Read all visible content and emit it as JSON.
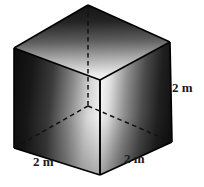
{
  "figure": {
    "name": "cube-diagram",
    "shape": "cube",
    "background_color": "#ffffff",
    "edge_color": "#000000",
    "labels": {
      "right_edge": "2 m",
      "bottom_left_edge": "2 m",
      "bottom_right_edge": "2 m"
    },
    "geometry": {
      "top_vertex": [
        88,
        5
      ],
      "top_left_vertex": [
        14,
        48
      ],
      "top_right_vertex": [
        170,
        42
      ],
      "center_top_vertex": [
        100,
        80
      ],
      "bottom_left_vertex": [
        14,
        148
      ],
      "bottom_front_vertex": [
        100,
        175
      ],
      "bottom_right_vertex": [
        172,
        142
      ],
      "hidden_back_bottom_vertex": [
        88,
        106
      ]
    },
    "shading": {
      "top_face_dark": "#1c1c1c",
      "top_face_light": "#f2f2f2",
      "left_face_dark": "#131313",
      "left_face_light": "#e8e8e8",
      "right_face_dark": "#171717",
      "right_face_light": "#f0f0f0"
    }
  }
}
